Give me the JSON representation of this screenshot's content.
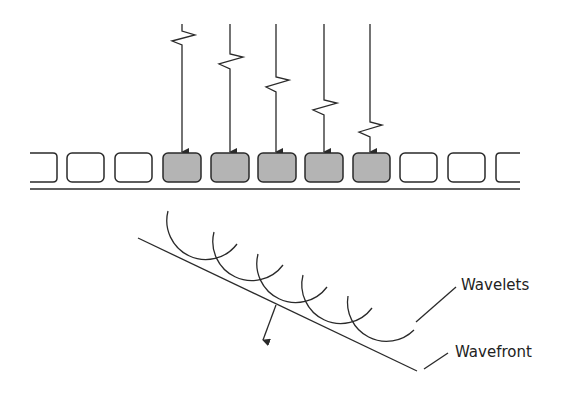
{
  "labels": {
    "wavelets": "Wavelets",
    "wavefront": "Wavefront"
  },
  "colors": {
    "stroke": "#2a2a2a",
    "active_element_fill": "#b4b4b4",
    "idle_element_fill": "#ffffff",
    "background": "#ffffff"
  },
  "array": {
    "element_count_visible": 11,
    "active_elements": 5,
    "partial_elements": [
      "left",
      "right"
    ]
  },
  "incident_pulses": {
    "count": 5,
    "delay_pattern": "increasing left to right"
  },
  "wavelet_arcs": 5
}
